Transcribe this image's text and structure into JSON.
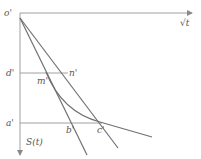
{
  "diagram": {
    "labels": {
      "origin": "o'",
      "x_axis": "√t",
      "y_axis": "S(t)",
      "d": "d'",
      "a": "a'",
      "n": "n'",
      "m": "m'",
      "b": "b'",
      "c": "c'"
    },
    "colors": {
      "axis": "#9a9a9a",
      "line": "#6e6e6e",
      "text": "#555555"
    }
  }
}
